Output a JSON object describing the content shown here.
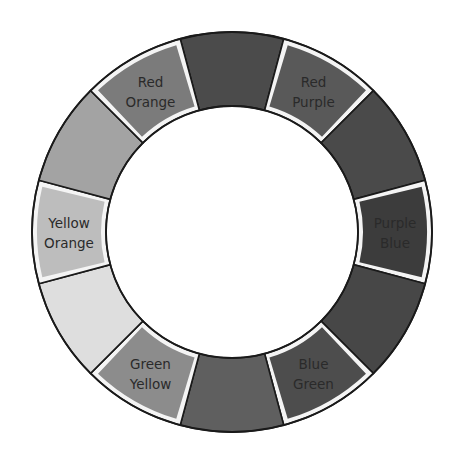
{
  "diagram": {
    "type": "color-wheel",
    "center": [
      232,
      232
    ],
    "outer_radius": 200,
    "inner_radius": 126,
    "segment_count": 12,
    "segments": [
      {
        "id": "red",
        "label": null,
        "fill": "#4b4b4b",
        "highlighted": false
      },
      {
        "id": "red-purple",
        "label": [
          "Red",
          "Purple"
        ],
        "fill": "#595959",
        "highlighted": true
      },
      {
        "id": "purple",
        "label": null,
        "fill": "#4a4a4a",
        "highlighted": false
      },
      {
        "id": "purple-blue",
        "label": [
          "Purple",
          "Blue"
        ],
        "fill": "#3c3c3c",
        "highlighted": true
      },
      {
        "id": "blue",
        "label": null,
        "fill": "#474747",
        "highlighted": false
      },
      {
        "id": "blue-green",
        "label": [
          "Blue",
          "Green"
        ],
        "fill": "#4d4d4d",
        "highlighted": true
      },
      {
        "id": "green",
        "label": null,
        "fill": "#5f5f5f",
        "highlighted": false
      },
      {
        "id": "green-yellow",
        "label": [
          "Green",
          "Yellow"
        ],
        "fill": "#8c8c8c",
        "highlighted": true
      },
      {
        "id": "yellow",
        "label": null,
        "fill": "#dedede",
        "highlighted": false
      },
      {
        "id": "yellow-orange",
        "label": [
          "Yellow",
          "Orange"
        ],
        "fill": "#bdbdbd",
        "highlighted": true
      },
      {
        "id": "orange",
        "label": null,
        "fill": "#a3a3a3",
        "highlighted": false
      },
      {
        "id": "red-orange",
        "label": [
          "Red",
          "Orange"
        ],
        "fill": "#7b7b7b",
        "highlighted": true
      }
    ],
    "labels": {
      "red_orange": [
        "Red",
        "Orange"
      ],
      "red_purple": [
        "Red",
        "Purple"
      ],
      "yellow_orange": [
        "Yellow",
        "Orange"
      ],
      "purple_blue": [
        "Purple",
        "Blue"
      ],
      "green_yellow": [
        "Green",
        "Yellow"
      ],
      "blue_green": [
        "Blue",
        "Green"
      ]
    },
    "colors": {
      "outline": "#1a1a1a",
      "frame": "#f4f4f4",
      "background": "#ffffff"
    }
  }
}
